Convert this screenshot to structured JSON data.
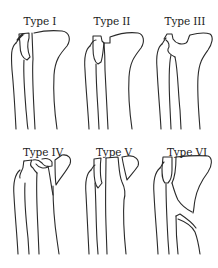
{
  "figure": {
    "panels": [
      {
        "id": "type-1",
        "label": "Type I"
      },
      {
        "id": "type-2",
        "label": "Type II"
      },
      {
        "id": "type-3",
        "label": "Type III"
      },
      {
        "id": "type-4",
        "label": "Type IV"
      },
      {
        "id": "type-5",
        "label": "Type V"
      },
      {
        "id": "type-6",
        "label": "Type VI"
      }
    ]
  }
}
